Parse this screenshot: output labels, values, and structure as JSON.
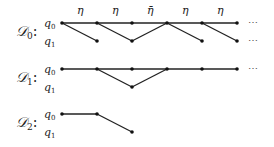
{
  "diagrams": [
    {
      "name": "D0",
      "label": "𝒟",
      "sub": "0",
      "row_labels": [
        "q",
        "q"
      ],
      "row_subs": [
        "0",
        "1"
      ],
      "edge_labels": [
        "η",
        "η",
        "η̄",
        "η",
        "η"
      ],
      "ellipsis": "⋯"
    },
    {
      "name": "D1",
      "label": "𝒟",
      "sub": "1",
      "row_labels": [
        "q",
        "q"
      ],
      "row_subs": [
        "0",
        "1"
      ],
      "ellipsis": "⋯"
    },
    {
      "name": "D2",
      "label": "𝒟",
      "sub": "2",
      "row_labels": [
        "q",
        "q"
      ],
      "row_subs": [
        "0",
        "1"
      ]
    }
  ],
  "colon": ":"
}
